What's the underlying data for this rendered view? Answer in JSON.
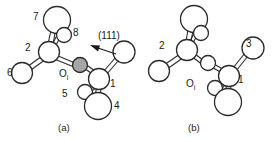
{
  "figure": {
    "type": "molecular-ball-and-stick-diagram",
    "colors": {
      "outline": "#2b2b2b",
      "atom_fill": "#ffffff",
      "highlight_fill": "#a6a6a6",
      "text": "#1a1a1a"
    },
    "panels": [
      {
        "id": "a",
        "caption": "(a)",
        "direction_label": "(111)",
        "oxygen_label": "O",
        "oxygen_subscript": "i",
        "oxygen_highlighted": true,
        "atom_labels": [
          {
            "text": "7",
            "x": 33,
            "y": 16
          },
          {
            "text": "8",
            "x": 73,
            "y": 32
          },
          {
            "text": "2",
            "x": 25,
            "y": 46
          },
          {
            "text": "6",
            "x": 8,
            "y": 71
          },
          {
            "text": "5",
            "x": 62,
            "y": 92
          },
          {
            "text": "1",
            "x": 108,
            "y": 85
          },
          {
            "text": "4",
            "x": 113,
            "y": 105
          }
        ]
      },
      {
        "id": "b",
        "caption": "(b)",
        "oxygen_label": "O",
        "oxygen_subscript": "i",
        "oxygen_highlighted": false,
        "atom_labels": [
          {
            "text": "2",
            "x": 160,
            "y": 44
          },
          {
            "text": "3",
            "x": 246,
            "y": 43
          },
          {
            "text": "1",
            "x": 237,
            "y": 79
          }
        ]
      }
    ]
  }
}
